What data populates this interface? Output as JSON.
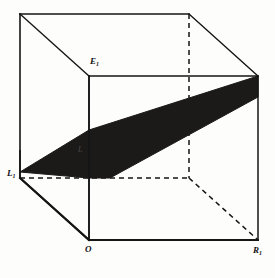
{
  "figure": {
    "kind": "3d-line-drawing",
    "background_color": "#fdfdfc",
    "line_color": "#151515",
    "plane_fill_color": "#1c1a19",
    "canvas": {
      "width": 275,
      "height": 278
    }
  },
  "labels": {
    "top_inner": {
      "text": "E",
      "sub": "1",
      "x": 90,
      "y": 60
    },
    "left_vertex": {
      "text": "L",
      "sub": "1",
      "x": 7,
      "y": 172
    },
    "origin": {
      "text": "O",
      "sub": "",
      "x": 85,
      "y": 247
    },
    "bottom_right": {
      "text": "R",
      "sub": "1",
      "x": 253,
      "y": 248
    },
    "interior_faint": {
      "text": "L",
      "sub": "",
      "x": 78,
      "y": 148
    }
  },
  "geometry": {
    "front_face": {
      "name": "front-face",
      "points": "89,76 258,76 258,240 89,240"
    },
    "back_face": {
      "name": "back-face",
      "points": "20,14 189,14 189,178 20,178"
    },
    "visible_vertices": {
      "front_top_left": [
        89,
        76
      ],
      "front_top_right": [
        258,
        76
      ],
      "front_bottom_left": [
        89,
        240
      ],
      "front_bottom_right": [
        258,
        240
      ],
      "back_top_left": [
        20,
        14
      ],
      "back_top_right": [
        189,
        14
      ],
      "back_bottom_left": [
        20,
        178
      ],
      "back_bottom_right": [
        189,
        178
      ]
    },
    "solid_edges": [
      "20,14 189,14",
      "20,14 20,178",
      "20,14 89,76",
      "89,76 258,76",
      "189,14 258,76",
      "89,76 89,240",
      "258,76 258,240",
      "89,240 258,240",
      "20,178 89,240",
      "20,178 20,14"
    ],
    "dashed_edges": [
      "189,14 189,178",
      "20,178 189,178",
      "189,178 258,240"
    ],
    "plane_polygon": {
      "name": "shaded-plane",
      "points": "20,172 89,130 258,76 258,96 111,177 89,177"
    }
  },
  "style": {
    "stroke_width_outer": 1.6,
    "stroke_width_inner": 1.3,
    "dash_pattern": "5,4"
  }
}
